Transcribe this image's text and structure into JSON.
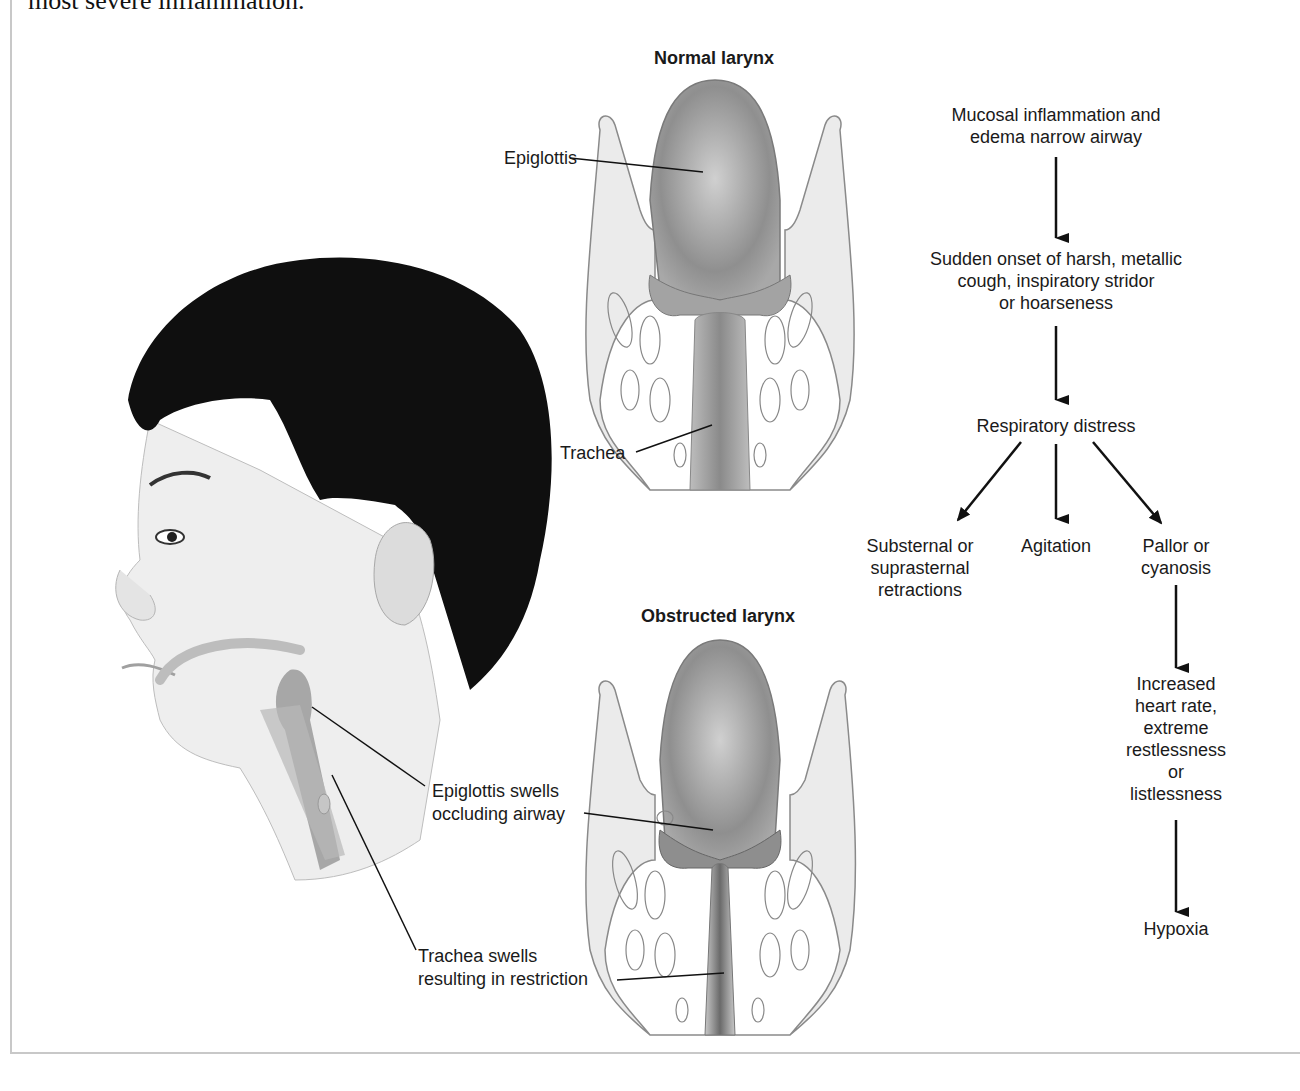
{
  "caption": "most severe inflammation.",
  "illustration": {
    "normal_larynx": {
      "title": "Normal larynx",
      "labels": {
        "epiglottis": "Epiglottis",
        "trachea": "Trachea"
      }
    },
    "obstructed_larynx": {
      "title": "Obstructed larynx",
      "labels": {
        "epiglottis": "Epiglottis swells occluding airway",
        "epiglottis_line1": "Epiglottis swells",
        "epiglottis_line2": "occluding airway",
        "trachea": "Trachea swells resulting in restriction",
        "trachea_line1": "Trachea swells",
        "trachea_line2": "resulting in restriction"
      }
    },
    "head_profile": "child-head-side-view"
  },
  "flowchart": {
    "nodes": [
      {
        "id": "inflammation",
        "lines": [
          "Mucosal inflammation and",
          "edema narrow airway"
        ]
      },
      {
        "id": "cough",
        "lines": [
          "Sudden onset of harsh, metallic",
          "cough, inspiratory stridor",
          "or hoarseness"
        ]
      },
      {
        "id": "distress",
        "lines": [
          "Respiratory distress"
        ]
      },
      {
        "id": "retractions",
        "lines": [
          "Substernal or",
          "suprasternal",
          "retractions"
        ]
      },
      {
        "id": "agitation",
        "lines": [
          "Agitation"
        ]
      },
      {
        "id": "pallor",
        "lines": [
          "Pallor or",
          "cyanosis"
        ]
      },
      {
        "id": "heart",
        "lines": [
          "Increased",
          "heart rate,",
          "extreme",
          "restlessness",
          "or",
          "listlessness"
        ]
      },
      {
        "id": "hypoxia",
        "lines": [
          "Hypoxia"
        ]
      }
    ],
    "edges": [
      [
        "inflammation",
        "cough"
      ],
      [
        "cough",
        "distress"
      ],
      [
        "distress",
        "retractions"
      ],
      [
        "distress",
        "agitation"
      ],
      [
        "distress",
        "pallor"
      ],
      [
        "pallor",
        "heart"
      ],
      [
        "heart",
        "hypoxia"
      ]
    ]
  },
  "colors": {
    "ink": "#1a1a1a",
    "tissue": "#e6e6e6",
    "tissue_dark": "#9a9a9a",
    "hair": "#0d0d0d",
    "skin": "#eeeeee"
  }
}
